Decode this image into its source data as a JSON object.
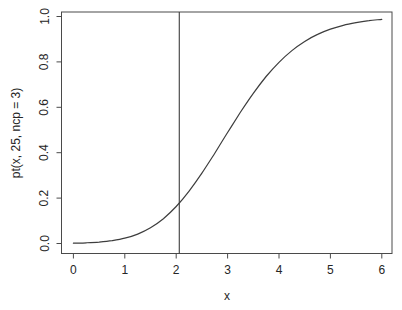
{
  "figure": {
    "background": "#ffffff",
    "line_color": "#4a4a4a",
    "curve_color": "#3d3d3d",
    "text_color": "#262626"
  },
  "chart_data": {
    "type": "line",
    "title": "",
    "xlabel": "x",
    "ylabel": "pt(x, 25, ncp = 3)",
    "xlim": [
      0,
      6
    ],
    "ylim": [
      0.0,
      1.0
    ],
    "xticks": [
      0,
      1,
      2,
      3,
      4,
      5,
      6
    ],
    "xtick_labels": [
      "0",
      "1",
      "2",
      "3",
      "4",
      "5",
      "6"
    ],
    "yticks": [
      0.0,
      0.2,
      0.4,
      0.6,
      0.8,
      1.0
    ],
    "ytick_labels": [
      "0.0",
      "0.2",
      "0.4",
      "0.6",
      "0.8",
      "1.0"
    ],
    "grid": false,
    "legend_position": "none",
    "box": true,
    "annotations": [
      {
        "type": "vline",
        "x": 2.06
      }
    ],
    "series": [
      {
        "name": "pt(x, 25, ncp = 3)",
        "x": [
          0,
          0.25,
          0.5,
          0.75,
          1,
          1.25,
          1.5,
          1.75,
          2,
          2.25,
          2.5,
          2.75,
          3,
          3.25,
          3.5,
          3.75,
          4,
          4.25,
          4.5,
          4.75,
          5,
          5.25,
          5.5,
          5.75,
          6
        ],
        "y": [
          0.0013,
          0.003,
          0.0062,
          0.0124,
          0.0233,
          0.0413,
          0.0692,
          0.1093,
          0.1632,
          0.2308,
          0.3103,
          0.398,
          0.489,
          0.5783,
          0.6616,
          0.7355,
          0.7983,
          0.8497,
          0.8902,
          0.9212,
          0.9444,
          0.9611,
          0.9732,
          0.9817,
          0.9875
        ]
      }
    ]
  }
}
